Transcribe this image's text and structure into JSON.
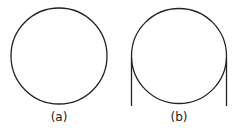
{
  "figures": [
    {
      "id": "a",
      "caption": "(a)",
      "description": "circle"
    },
    {
      "id": "b",
      "caption": "(b)",
      "description": "circle with two tangent vertical lines"
    }
  ],
  "colors": {
    "stroke": "#222222",
    "background": "#ffffff"
  }
}
